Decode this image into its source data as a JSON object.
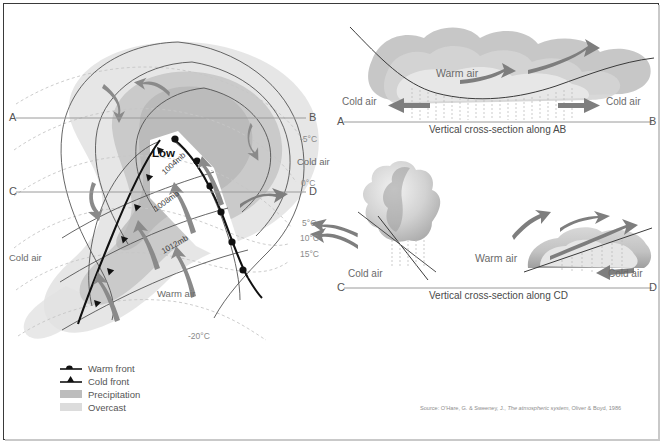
{
  "figure": {
    "background": "#ffffff",
    "border_color": "#3a3a3a"
  },
  "colors": {
    "precipitation": "#b9b9b9",
    "overcast": "#dcdcdc",
    "front_line": "#1a1a1a",
    "isobar": "#4f4f4f",
    "isotherm": "#bdbdbd",
    "arrow": "#8a8a8a",
    "section_line": "#9a9a9a",
    "text": "#4a4a4a"
  },
  "main_map": {
    "low_label": "Low",
    "section_endpoints": [
      {
        "name": "A",
        "label": "A"
      },
      {
        "name": "B",
        "label": "B"
      },
      {
        "name": "C",
        "label": "C"
      },
      {
        "name": "D",
        "label": "D"
      }
    ],
    "isobars": [
      {
        "label": "1004mb",
        "value": 1004,
        "unit": "mb"
      },
      {
        "label": "1008mb",
        "value": 1008,
        "unit": "mb"
      },
      {
        "label": "1012mb",
        "value": 1012,
        "unit": "mb"
      }
    ],
    "isotherms": [
      {
        "label": "-5°C",
        "value": -5
      },
      {
        "label": "0°C",
        "value": 0
      },
      {
        "label": "5°C",
        "value": 5
      },
      {
        "label": "10°C",
        "value": 10
      },
      {
        "label": "15°C",
        "value": 15
      },
      {
        "label": "-20°C",
        "value": -20
      }
    ],
    "air_masses": [
      {
        "label": "Cold air",
        "position": "right"
      },
      {
        "label": "Cold air",
        "position": "left"
      },
      {
        "label": "Warm air",
        "position": "lower-centre"
      }
    ]
  },
  "legend": {
    "items": [
      {
        "symbol": "warm-front",
        "label": "Warm front"
      },
      {
        "symbol": "cold-front",
        "label": "Cold front"
      },
      {
        "symbol": "swatch-dark",
        "label": "Precipitation"
      },
      {
        "symbol": "swatch-light",
        "label": "Overcast"
      }
    ]
  },
  "cross_section_ab": {
    "caption": "Vertical cross-section along AB",
    "left_endpoint": "A",
    "right_endpoint": "B",
    "labels": [
      {
        "text": "Warm air",
        "position": "centre"
      },
      {
        "text": "Cold air",
        "position": "left"
      },
      {
        "text": "Cold air",
        "position": "right"
      }
    ]
  },
  "cross_section_cd": {
    "caption": "Vertical cross-section along CD",
    "left_endpoint": "C",
    "right_endpoint": "D",
    "labels": [
      {
        "text": "Cold air",
        "position": "left"
      },
      {
        "text": "Warm air",
        "position": "centre"
      },
      {
        "text": "Cold air",
        "position": "right"
      }
    ]
  },
  "source": {
    "prefix": "Source: O'Hare, G. & Sweeney, J.,",
    "title": "The atmospheric system",
    "suffix": ", Oliver & Boyd, 1986"
  }
}
